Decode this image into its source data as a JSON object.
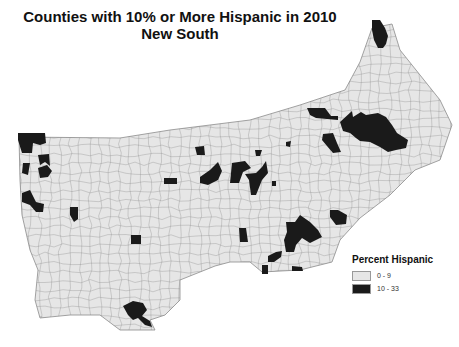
{
  "title": {
    "line1": "Counties with 10% or More Hispanic in 2010",
    "line2": "New South"
  },
  "legend": {
    "title": "Percent Hispanic",
    "items": [
      {
        "label": "0 - 9",
        "color": "#e6e6e6"
      },
      {
        "label": "10 - 33",
        "color": "#1a1a1a"
      }
    ]
  },
  "colors": {
    "base_fill": "#e6e6e6",
    "county_border": "#8c8c8c",
    "highlight": "#1a1a1a"
  },
  "regions": [
    {
      "name": "northwest-arkansas-cluster"
    },
    {
      "name": "western-arkansas-cluster"
    },
    {
      "name": "southwest-arkansas-cluster"
    },
    {
      "name": "central-arkansas-county"
    },
    {
      "name": "central-mississippi-county"
    },
    {
      "name": "west-tennessee-county"
    },
    {
      "name": "middle-tennessee-county"
    },
    {
      "name": "north-alabama-cluster"
    },
    {
      "name": "north-georgia-cluster"
    },
    {
      "name": "east-tennessee-county"
    },
    {
      "name": "northern-virginia-cluster"
    },
    {
      "name": "north-carolina-piedmont-cluster"
    },
    {
      "name": "eastern-north-carolina-cluster"
    },
    {
      "name": "southeast-georgia-cluster"
    },
    {
      "name": "coastal-georgia-county"
    },
    {
      "name": "south-georgia-counties"
    },
    {
      "name": "southeast-louisiana-parishes"
    }
  ]
}
